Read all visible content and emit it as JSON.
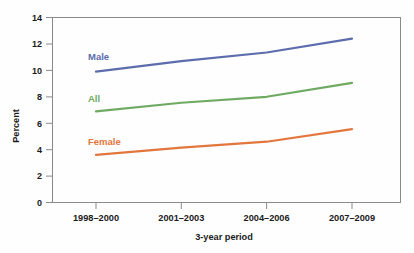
{
  "chart_data": {
    "type": "line",
    "title": "",
    "xlabel": "3-year period",
    "ylabel": "Percent",
    "categories": [
      "1998–2000",
      "2001–2003",
      "2004–2006",
      "2007–2009"
    ],
    "ylim": [
      0,
      14
    ],
    "yticks": [
      0,
      2,
      4,
      6,
      8,
      10,
      12,
      14
    ],
    "ytick_labels": [
      "0",
      "2",
      "4",
      "6",
      "8",
      "10",
      "12",
      "14"
    ],
    "grid": false,
    "legend_position": "inline-left",
    "series": [
      {
        "name": "Male",
        "color": "#5c6cad",
        "values": [
          9.9,
          10.7,
          11.35,
          12.4
        ],
        "label_text": "Male"
      },
      {
        "name": "All",
        "color": "#6faa63",
        "values": [
          6.9,
          7.55,
          8.0,
          9.05
        ],
        "label_text": "All"
      },
      {
        "name": "Female",
        "color": "#e2763c",
        "values": [
          3.6,
          4.15,
          4.6,
          5.55
        ],
        "label_text": "Female"
      }
    ]
  },
  "axis": {
    "y_title": "Percent",
    "x_title": "3-year period",
    "y_labels": [
      "14",
      "12",
      "10",
      "8",
      "6",
      "4",
      "2",
      "0"
    ],
    "x_labels": [
      "1998–2000",
      "2001–2003",
      "2004–2006",
      "2007–2009"
    ]
  },
  "series_labels": {
    "male": "Male",
    "all": "All",
    "female": "Female"
  },
  "colors": {
    "male": "#5c6cad",
    "all": "#6faa63",
    "female": "#e2763c",
    "axis": "#8a8a8a",
    "text": "#1a1a1a",
    "background": "#fefefe"
  }
}
